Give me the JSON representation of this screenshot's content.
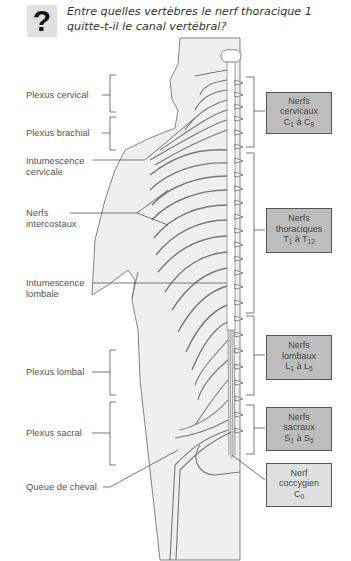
{
  "question": {
    "icon": "question-mark-icon",
    "icon_glyph": "?",
    "text": "Entre quelles vertèbres le nerf thoracique 1 quitte-t-il le canal vertébral?"
  },
  "left_labels": {
    "plexus_cervical": "Plexus cervical",
    "plexus_brachial": "Plexus brachial",
    "intumescence_cervicale_1": "Intumescence",
    "intumescence_cervicale_2": "cervicale",
    "nerfs_intercostaux_1": "Nerfs",
    "nerfs_intercostaux_2": "intercostaux",
    "intumescence_lombale_1": "Intumescence",
    "intumescence_lombale_2": "lombale",
    "plexus_lombal": "Plexus lombal",
    "plexus_sacral": "Plexus sacral",
    "queue_de_cheval": "Queue de cheval"
  },
  "right_boxes": {
    "cervicaux": {
      "line1": "Nerfs",
      "line2": "cervicaux",
      "a": "C",
      "a_sub": "1",
      "mid": " à ",
      "b": "C",
      "b_sub": "8"
    },
    "thoraciques": {
      "line1": "Nerfs",
      "line2": "thoraciques",
      "a": "T",
      "a_sub": "1",
      "mid": " à ",
      "b": "T",
      "b_sub": "12"
    },
    "lombaux": {
      "line1": "Nerfs",
      "line2": "lombaux",
      "a": "L",
      "a_sub": "1",
      "mid": " à ",
      "b": "L",
      "b_sub": "5"
    },
    "sacraux": {
      "line1": "Nerfs",
      "line2": "sacraux",
      "a": "S",
      "a_sub": "1",
      "mid": " à ",
      "b": "S",
      "b_sub": "5"
    },
    "coccygien": {
      "line1": "Nerf",
      "line2": "coccygien",
      "a": "C",
      "a_sub": "0"
    }
  },
  "colors": {
    "body_fill": "#efefef",
    "outline": "#555555",
    "box_dark": "#bdbdbd",
    "box_light": "#e0e0e0"
  }
}
